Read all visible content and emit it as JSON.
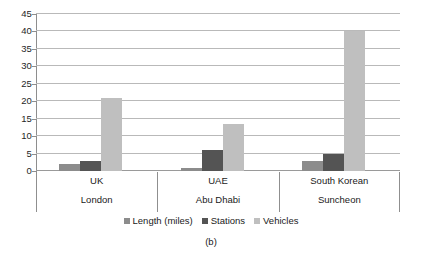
{
  "caption": "(b)",
  "chart_data": {
    "type": "bar",
    "title": "",
    "xlabel": "",
    "ylabel": "",
    "ylim": [
      0,
      45
    ],
    "ytick_step": 5,
    "yticks": [
      0,
      5,
      10,
      15,
      20,
      25,
      30,
      35,
      40,
      45
    ],
    "ytick_labels": [
      "0",
      "5",
      "10",
      "15",
      "20",
      "25",
      "30",
      "35",
      "40",
      "45"
    ],
    "grid": true,
    "legend_position": "bottom",
    "categories": [
      "UK",
      "UAE",
      "South Korean"
    ],
    "category_sublabels": [
      "London",
      "Abu Dhabi",
      "Suncheon"
    ],
    "series": [
      {
        "name": "Length (miles)",
        "color": "#8c8c8c",
        "values": [
          2,
          1,
          3
        ]
      },
      {
        "name": "Stations",
        "color": "#545454",
        "values": [
          3,
          6,
          5
        ]
      },
      {
        "name": "Vehicles",
        "color": "#bfbfbf",
        "values": [
          21,
          13.5,
          40
        ]
      }
    ]
  }
}
